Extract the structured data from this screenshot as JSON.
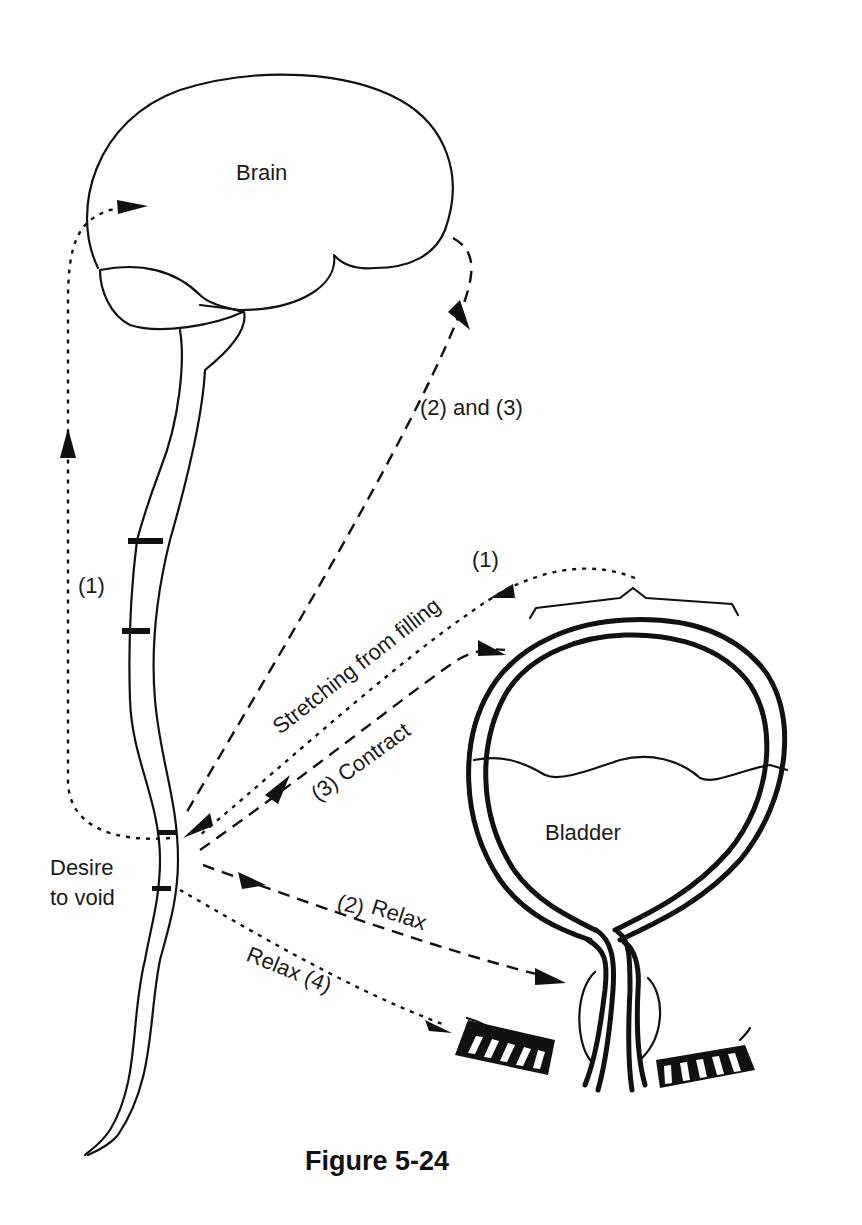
{
  "figure": {
    "caption": "Figure 5-24",
    "type": "physiology diagram — micturition (voiding) reflex pathway"
  },
  "structures": {
    "brain": "Brain",
    "bladder": "Bladder",
    "spinal_cord": "spinal cord",
    "internal_sphincter": "internal sphincter",
    "external_sphincter": "external sphincter"
  },
  "labels": {
    "desire_line1": "Desire",
    "desire_line2": "to void",
    "path_1_ascending": "(1)",
    "path_1_bladder": "(1)",
    "stretching": "Stretching from filling",
    "descending": "(2) and (3)",
    "contract": "(3) Contract",
    "relax_2_num": "(2)",
    "relax_2_word": "Relax",
    "relax_4": "Relax (4)"
  },
  "pathways": [
    {
      "id": "1",
      "style": "dotted",
      "from": "bladder",
      "to": "brain",
      "via": "spinal cord",
      "label": "Stretching from filling"
    },
    {
      "id": "2-3",
      "style": "dashed",
      "from": "brain",
      "to": "spinal cord",
      "label": "(2) and (3)"
    },
    {
      "id": "3",
      "style": "dashed",
      "from": "spinal cord",
      "to": "bladder wall",
      "label": "(3) Contract"
    },
    {
      "id": "2",
      "style": "dashed",
      "from": "spinal cord",
      "to": "internal sphincter",
      "label": "(2) Relax"
    },
    {
      "id": "4",
      "style": "dotted",
      "from": "spinal cord",
      "to": "external sphincter",
      "label": "Relax (4)"
    }
  ]
}
